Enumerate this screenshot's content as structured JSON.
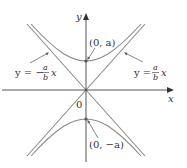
{
  "figure": {
    "type": "hyperbola-with-asymptotes",
    "axes": {
      "x_label": "x",
      "y_label": "y",
      "origin_label": "0"
    },
    "vertices": {
      "top_label": "(0, a)",
      "bottom_label": "(0, −a)"
    },
    "asymptotes": {
      "left_label_prefix": "y = −",
      "left_label_num": "a",
      "left_label_den": "b",
      "left_label_suffix": "x",
      "right_label_prefix": "y =",
      "right_label_num": "a",
      "right_label_den": "b",
      "right_label_suffix": "x"
    },
    "colors": {
      "axis": "#555555",
      "curve": "#8a8a8a",
      "asymptote": "#8a8a8a",
      "text": "#333333",
      "vertex_dot": "#555555"
    }
  }
}
